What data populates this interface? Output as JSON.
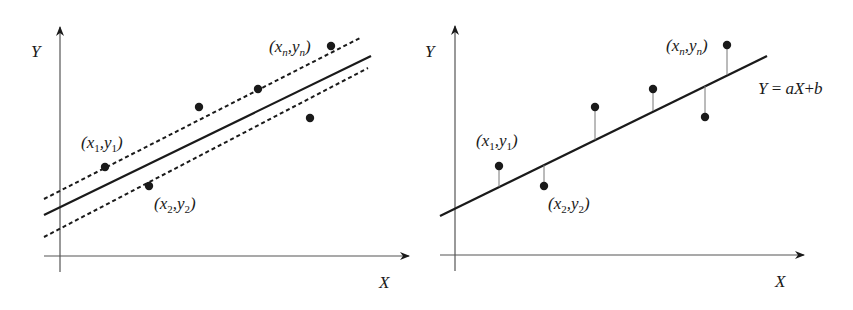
{
  "figures": [
    {
      "id": "left",
      "description": "Scatter points with fitted regression line and dashed confidence band",
      "axes": {
        "x_label": "X",
        "y_label": "Y"
      },
      "point_labels": [
        {
          "var": "x",
          "sub": "1",
          "var2": "y",
          "sub2": "1"
        },
        {
          "var": "x",
          "sub": "2",
          "var2": "y",
          "sub2": "2"
        },
        {
          "var": "x",
          "sub": "n",
          "var2": "y",
          "sub2": "n"
        }
      ],
      "points": [
        [
          105,
          167
        ],
        [
          149,
          186
        ],
        [
          199,
          107
        ],
        [
          258,
          89
        ],
        [
          310,
          118
        ],
        [
          331,
          46
        ]
      ],
      "fit_line": [
        [
          44,
          215
        ],
        [
          371,
          56
        ]
      ],
      "upper_band": [
        [
          44,
          199
        ],
        [
          360,
          38
        ]
      ],
      "lower_band": [
        [
          44,
          237
        ],
        [
          368,
          68
        ]
      ]
    },
    {
      "id": "right",
      "description": "Scatter points with regression line and vertical residuals",
      "axes": {
        "x_label": "X",
        "y_label": "Y"
      },
      "equation": {
        "lhs": "Y",
        "eq": " = ",
        "a": "a",
        "X": "X",
        "plus": "+",
        "b": "b"
      },
      "point_labels": [
        {
          "var": "x",
          "sub": "1",
          "var2": "y",
          "sub2": "1"
        },
        {
          "var": "x",
          "sub": "2",
          "var2": "y",
          "sub2": "2"
        },
        {
          "var": "x",
          "sub": "n",
          "var2": "y",
          "sub2": "n"
        }
      ],
      "points": [
        [
          499,
          166
        ],
        [
          544,
          186
        ],
        [
          595,
          107
        ],
        [
          653,
          89
        ],
        [
          705,
          117
        ],
        [
          727,
          45
        ]
      ],
      "fit_line": [
        [
          440,
          216
        ],
        [
          767,
          56
        ]
      ]
    }
  ],
  "colors": {
    "ink": "#1a1a1a",
    "axis": "#555555",
    "residual": "#777777"
  }
}
